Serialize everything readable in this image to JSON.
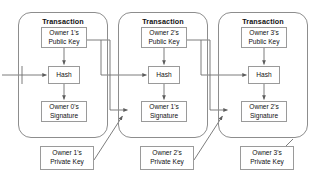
{
  "diagram": {
    "colors": {
      "line": "#666666",
      "box_border": "#9a9a9a",
      "card_border": "#8d8d8d",
      "background": "#ffffff",
      "text": "#111111"
    },
    "transactions": [
      {
        "id": "transaction-1",
        "title": "Transaction",
        "public_key": {
          "line1": "Owner 1's",
          "line2": "Public Key"
        },
        "hash": {
          "label": "Hash"
        },
        "signature": {
          "line1": "Owner 0's",
          "line2": "Signature"
        }
      },
      {
        "id": "transaction-2",
        "title": "Transaction",
        "public_key": {
          "line1": "Owner 2's",
          "line2": "Public Key"
        },
        "hash": {
          "label": "Hash"
        },
        "signature": {
          "line1": "Owner 1's",
          "line2": "Signature"
        }
      },
      {
        "id": "transaction-3",
        "title": "Transaction",
        "public_key": {
          "line1": "Owner 3's",
          "line2": "Public Key"
        },
        "hash": {
          "label": "Hash"
        },
        "signature": {
          "line1": "Owner 2's",
          "line2": "Signature"
        }
      }
    ],
    "private_keys": [
      {
        "id": "private-key-1",
        "line1": "Owner 1's",
        "line2": "Private Key"
      },
      {
        "id": "private-key-2",
        "line1": "Owner 2's",
        "line2": "Private Key"
      },
      {
        "id": "private-key-3",
        "line1": "Owner 3's",
        "line2": "Private Key"
      }
    ]
  }
}
